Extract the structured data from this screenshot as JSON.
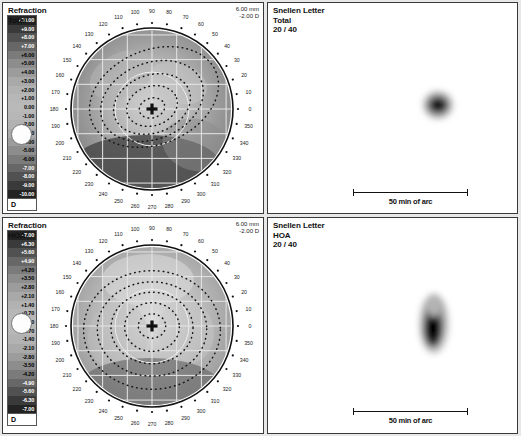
{
  "meta": {
    "app": "wavefront-aberrometry-report",
    "units_label": "D",
    "scale_bar_label": "50 min of arc"
  },
  "panels": {
    "refraction_total": {
      "title": "Refraction",
      "subtitle": "Total",
      "corner_top": "6.00 mm",
      "corner_bottom": "-2.00 D",
      "scale_unit": "D",
      "scale_labels": [
        "+10.00",
        "+9.00",
        "+8.00",
        "+7.00",
        "+6.00",
        "+5.00",
        "+4.00",
        "+3.00",
        "+2.00",
        "+1.00",
        "0.00",
        "-1.00",
        "-2.00",
        "-3.00",
        "-4.00",
        "-5.00",
        "-6.00",
        "-7.00",
        "-8.00",
        "-9.00",
        "-10.00"
      ],
      "scale_marker_value": "-3.00",
      "axis_labels": [
        "0",
        "10",
        "20",
        "30",
        "40",
        "50",
        "60",
        "70",
        "80",
        "90",
        "100",
        "110",
        "120",
        "130",
        "140",
        "150",
        "160",
        "170",
        "180",
        "190",
        "200",
        "210",
        "220",
        "230",
        "240",
        "250",
        "260",
        "270",
        "280",
        "290",
        "300",
        "310",
        "320",
        "330",
        "340",
        "350"
      ]
    },
    "refraction_hoa": {
      "title": "Refraction",
      "subtitle": "HOA",
      "corner_top": "6.00 mm",
      "corner_bottom": "-2.00 D",
      "scale_unit": "D",
      "scale_labels": [
        "+7.00",
        "+6.30",
        "+5.60",
        "+4.90",
        "+4.20",
        "+3.50",
        "+2.80",
        "+2.10",
        "+1.40",
        "+0.70",
        "0.00",
        "-0.70",
        "-1.40",
        "-2.10",
        "-2.80",
        "-3.50",
        "-4.20",
        "-4.90",
        "-5.60",
        "-6.30",
        "-7.00"
      ],
      "scale_marker_value": "0.00",
      "axis_labels": [
        "0",
        "10",
        "20",
        "30",
        "40",
        "50",
        "60",
        "70",
        "80",
        "90",
        "100",
        "110",
        "120",
        "130",
        "140",
        "150",
        "160",
        "170",
        "180",
        "190",
        "200",
        "210",
        "220",
        "230",
        "240",
        "250",
        "260",
        "270",
        "280",
        "290",
        "300",
        "310",
        "320",
        "330",
        "340",
        "350"
      ]
    },
    "snellen_total": {
      "title": "Snellen Letter",
      "subtitle": "Total",
      "acuity": "20 / 40",
      "scale_bar_label": "50 min of arc"
    },
    "snellen_hoa": {
      "title": "Snellen Letter",
      "subtitle": "HOA",
      "acuity": "20 / 40",
      "scale_bar_label": "50 min of arc"
    }
  },
  "chart_data": [
    {
      "type": "heatmap",
      "name": "refraction-total-polar-map",
      "title": "Refraction Total",
      "units": "D",
      "pupil_diameter_mm": 6.0,
      "colorbar_min": -10.0,
      "colorbar_max": 10.0,
      "colorbar_step": 1.0,
      "marker_value": -2.0,
      "axis_type": "polar-degrees",
      "axis_range": [
        0,
        360
      ],
      "axis_tick_step": 10,
      "contour_style": "dotted-iso-lines",
      "contour_count": 5,
      "center_marker": "crosshair"
    },
    {
      "type": "heatmap",
      "name": "refraction-hoa-polar-map",
      "title": "Refraction HOA",
      "units": "D",
      "pupil_diameter_mm": 6.0,
      "colorbar_min": -7.0,
      "colorbar_max": 7.0,
      "colorbar_step": 0.7,
      "marker_value": -2.0,
      "axis_type": "polar-degrees",
      "axis_range": [
        0,
        360
      ],
      "axis_tick_step": 10,
      "contour_style": "dotted-iso-lines",
      "contour_count": 5,
      "center_marker": "crosshair"
    },
    {
      "type": "image",
      "name": "snellen-total-psf",
      "title": "Snellen Letter Total",
      "acuity": "20 / 40",
      "scale_bar": "50 min of arc"
    },
    {
      "type": "image",
      "name": "snellen-hoa-psf",
      "title": "Snellen Letter HOA",
      "acuity": "20 / 40",
      "scale_bar": "50 min of arc"
    }
  ]
}
